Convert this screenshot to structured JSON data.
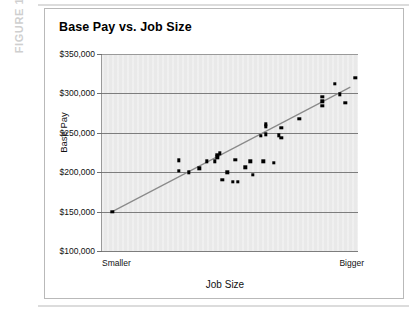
{
  "figure": {
    "label": "FIGURE 1-1"
  },
  "chart_data": {
    "type": "scatter",
    "title": "Base Pay vs. Job Size",
    "xlabel": "Job Size",
    "ylabel": "Base Pay",
    "grid": true,
    "legend": false,
    "xlim": [
      0,
      100
    ],
    "ylim": [
      100000,
      350000
    ],
    "ytick_labels": [
      "$350,000",
      "$300,000",
      "$250,000",
      "$200,000",
      "$150,000",
      "$100,000"
    ],
    "ytick_values": [
      350000,
      300000,
      250000,
      200000,
      150000,
      100000
    ],
    "xtick_labels": [
      "Smaller",
      "Bigger"
    ],
    "xtick_values": [
      0,
      100
    ],
    "point_color": "#000000",
    "trendline_color": "#8a8a8a",
    "plot_background": "#e9e9e9",
    "points": [
      {
        "x": 4,
        "y": 150000
      },
      {
        "x": 30,
        "y": 215000
      },
      {
        "x": 30,
        "y": 202000
      },
      {
        "x": 34,
        "y": 200000
      },
      {
        "x": 38,
        "y": 205000
      },
      {
        "x": 41,
        "y": 214000
      },
      {
        "x": 44,
        "y": 214000
      },
      {
        "x": 45,
        "y": 219000
      },
      {
        "x": 45,
        "y": 222000
      },
      {
        "x": 46,
        "y": 224000
      },
      {
        "x": 47,
        "y": 190000
      },
      {
        "x": 49,
        "y": 200000
      },
      {
        "x": 51,
        "y": 188000
      },
      {
        "x": 52,
        "y": 216000
      },
      {
        "x": 53,
        "y": 188000
      },
      {
        "x": 56,
        "y": 206000
      },
      {
        "x": 58,
        "y": 214000
      },
      {
        "x": 59,
        "y": 197000
      },
      {
        "x": 62,
        "y": 246000
      },
      {
        "x": 63,
        "y": 214000
      },
      {
        "x": 64,
        "y": 248000
      },
      {
        "x": 64,
        "y": 258000
      },
      {
        "x": 64,
        "y": 261000
      },
      {
        "x": 67,
        "y": 212000
      },
      {
        "x": 69,
        "y": 247000
      },
      {
        "x": 70,
        "y": 256000
      },
      {
        "x": 70,
        "y": 244000
      },
      {
        "x": 77,
        "y": 268000
      },
      {
        "x": 86,
        "y": 296000
      },
      {
        "x": 86,
        "y": 290000
      },
      {
        "x": 86,
        "y": 284000
      },
      {
        "x": 91,
        "y": 312000
      },
      {
        "x": 93,
        "y": 299000
      },
      {
        "x": 95,
        "y": 288000
      },
      {
        "x": 99,
        "y": 320000
      }
    ],
    "trendline": {
      "x0": 4,
      "y0": 150000,
      "x1": 97,
      "y1": 308000
    }
  }
}
